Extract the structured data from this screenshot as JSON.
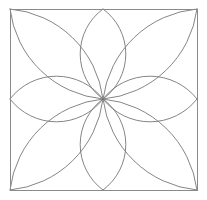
{
  "figure": {
    "background_color": "#ffffff",
    "canvas": {
      "width": 207,
      "height": 200
    }
  },
  "frame": {
    "name": "square-border",
    "x": 10,
    "y": 9,
    "width": 187,
    "height": 181,
    "stroke_color": "#8a8a8a",
    "stroke_width": 1,
    "fill": "none"
  },
  "geometry": {
    "center": {
      "x": 103,
      "y": 99
    },
    "petal_count": 8,
    "arc_count": 16,
    "stroke_color": "#777777",
    "stroke_width": 0.9,
    "description": "Sixteen circular arcs converge at the center point, pairing into eight lens-shaped petals: two vertical, two horizontal, and four diagonal.",
    "edge_crossings": {
      "top_edge_x": [
        80,
        126
      ],
      "bottom_edge_x": [
        80,
        126
      ],
      "left_edge_y": [
        76,
        122
      ],
      "right_edge_y": [
        76,
        122
      ]
    },
    "petals": [
      {
        "name": "petal-north",
        "angle_deg": 270,
        "tip": {
          "x": 103,
          "y": 9
        },
        "half_width": 23
      },
      {
        "name": "petal-northeast",
        "angle_deg": 315,
        "tip": {
          "x": 197,
          "y": 9
        },
        "half_width": 23
      },
      {
        "name": "petal-east",
        "angle_deg": 0,
        "tip": {
          "x": 197,
          "y": 99
        },
        "half_width": 23
      },
      {
        "name": "petal-southeast",
        "angle_deg": 45,
        "tip": {
          "x": 197,
          "y": 190
        },
        "half_width": 23
      },
      {
        "name": "petal-south",
        "angle_deg": 90,
        "tip": {
          "x": 103,
          "y": 190
        },
        "half_width": 23
      },
      {
        "name": "petal-southwest",
        "angle_deg": 135,
        "tip": {
          "x": 10,
          "y": 190
        },
        "half_width": 23
      },
      {
        "name": "petal-west",
        "angle_deg": 180,
        "tip": {
          "x": 10,
          "y": 99
        },
        "half_width": 23
      },
      {
        "name": "petal-northwest",
        "angle_deg": 225,
        "tip": {
          "x": 10,
          "y": 9
        },
        "half_width": 23
      }
    ]
  }
}
